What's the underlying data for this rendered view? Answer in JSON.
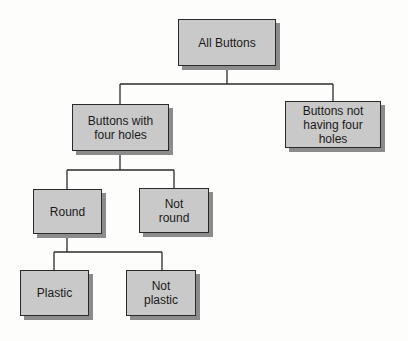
{
  "diagram": {
    "type": "tree",
    "colors": {
      "node_fill": "#c9c9c9",
      "node_border": "#2a2a2a",
      "node_shadow": "#8c8c8c",
      "connector": "#2a2a2a"
    },
    "nodes": {
      "root": {
        "label": "All Buttons"
      },
      "four_holes": {
        "label": "Buttons with\nfour holes"
      },
      "not_four_holes": {
        "label": "Buttons not\nhaving four\nholes"
      },
      "round": {
        "label": "Round"
      },
      "not_round": {
        "label": "Not\nround"
      },
      "plastic": {
        "label": "Plastic"
      },
      "not_plastic": {
        "label": "Not\nplastic"
      }
    },
    "edges": [
      {
        "from": "All Buttons",
        "to": "Buttons with four holes"
      },
      {
        "from": "All Buttons",
        "to": "Buttons not having four holes"
      },
      {
        "from": "Buttons with four holes",
        "to": "Round"
      },
      {
        "from": "Buttons with four holes",
        "to": "Not round"
      },
      {
        "from": "Round",
        "to": "Plastic"
      },
      {
        "from": "Round",
        "to": "Not plastic"
      }
    ]
  }
}
